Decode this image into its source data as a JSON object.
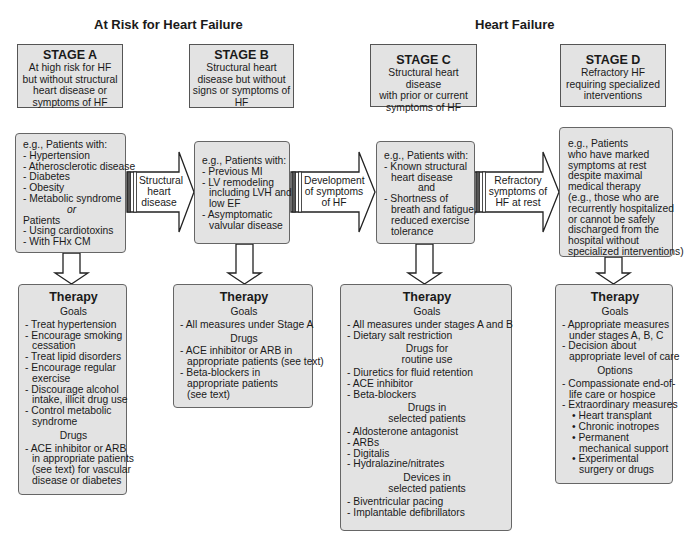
{
  "headings": {
    "at_risk": "At Risk for Heart Failure",
    "heart_failure": "Heart Failure"
  },
  "stages": [
    {
      "name": "STAGE A",
      "desc": [
        "At high risk for HF",
        "but without structural",
        "heart disease or",
        "symptoms of HF"
      ]
    },
    {
      "name": "STAGE B",
      "desc": [
        "Structural heart",
        "disease but without",
        "signs or symptoms of",
        "HF"
      ]
    },
    {
      "name": "STAGE C",
      "desc": [
        "Structural heart disease",
        "with prior or current",
        "symptoms of HF"
      ]
    },
    {
      "name": "STAGE D",
      "desc": [
        "Refractory HF",
        "requiring specialized",
        "interventions"
      ]
    }
  ],
  "patients": {
    "a": {
      "intro": "e.g., Patients with:",
      "items": [
        "- Hypertension",
        "- Atherosclerotic disease",
        "- Diabetes",
        "- Obesity",
        "- Metabolic syndrome"
      ],
      "or": "or",
      "intro2": "Patients",
      "items2": [
        "- Using cardiotoxins",
        "- With FHx CM"
      ]
    },
    "b": {
      "intro": "e.g., Patients with:",
      "lines": [
        "- Previous MI",
        "- LV remodeling",
        "including LVH and",
        "low EF",
        "- Asymptomatic",
        "valvular disease"
      ]
    },
    "c": {
      "intro": "e.g., Patients with:",
      "lines": [
        "- Known structural",
        "heart disease",
        "and",
        "- Shortness of",
        "breath and fatigue,",
        "reduced exercise",
        "tolerance"
      ]
    },
    "d": {
      "lines": [
        "e.g., Patients",
        "who have marked",
        "symptoms at rest",
        "despite maximal",
        "medical therapy",
        "(e.g., those who are",
        "recurrently hospitalized",
        "or cannot be safely",
        "discharged from the",
        "hospital without",
        "specialized interventions)"
      ]
    }
  },
  "transitions": [
    {
      "lines": [
        "Structural",
        "heart",
        "disease"
      ]
    },
    {
      "lines": [
        "Development",
        "of symptoms",
        "of HF"
      ]
    },
    {
      "lines": [
        "Refractory",
        "symptoms of",
        "HF at rest"
      ]
    }
  ],
  "therapy": {
    "title": "Therapy",
    "a": {
      "goals_label": "Goals",
      "goals": [
        [
          "- Treat hypertension"
        ],
        [
          "- Encourage smoking",
          "cessation"
        ],
        [
          "- Treat lipid disorders"
        ],
        [
          "- Encourage regular",
          "exercise"
        ],
        [
          "- Discourage alcohol",
          "intake, illicit drug use"
        ],
        [
          "- Control metabolic",
          "syndrome"
        ]
      ],
      "drugs_label": "Drugs",
      "drugs": [
        [
          "- ACE inhibitor or ARB",
          "in appropriate patients",
          "(see text) for vascular",
          "disease or diabetes"
        ]
      ]
    },
    "b": {
      "goals_label": "Goals",
      "goals": [
        [
          "- All measures under Stage A"
        ]
      ],
      "drugs_label": "Drugs",
      "drugs": [
        [
          "- ACE inhibitor or ARB in",
          "appropriate patients (see text)"
        ],
        [
          "- Beta-blockers in",
          "appropriate patients",
          "(see text)"
        ]
      ]
    },
    "c": {
      "goals_label": "Goals",
      "goals": [
        "- All measures under stages A and B",
        "- Dietary salt restriction"
      ],
      "routine_label": [
        "Drugs for",
        "routine use"
      ],
      "routine": [
        "- Diuretics for fluid retention",
        "- ACE inhibitor",
        "- Beta-blockers"
      ],
      "selected_label": [
        "Drugs in",
        "selected patients"
      ],
      "selected": [
        "- Aldosterone antagonist",
        "- ARBs",
        "- Digitalis",
        "- Hydralazine/nitrates"
      ],
      "devices_label": [
        "Devices in",
        "selected patients"
      ],
      "devices": [
        "- Biventricular pacing",
        "- Implantable defibrillators"
      ]
    },
    "d": {
      "goals_label": "Goals",
      "goals": [
        [
          "- Appropriate measures",
          "under stages A, B, C"
        ],
        [
          "- Decision about",
          "appropriate level of care"
        ]
      ],
      "options_label": "Options",
      "options": [
        [
          "- Compassionate end-of-",
          "life care or hospice"
        ],
        [
          "- Extraordinary measures"
        ]
      ],
      "extraordinary": [
        [
          "• Heart transplant"
        ],
        [
          "• Chronic inotropes"
        ],
        [
          "• Permanent",
          "mechanical support"
        ],
        [
          "• Experimental",
          "surgery or drugs"
        ]
      ]
    }
  },
  "colors": {
    "box_fill": "#e3e3e3",
    "border": "#555555",
    "arrow_fill": "#ffffff"
  }
}
